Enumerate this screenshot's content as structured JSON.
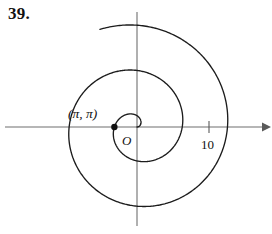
{
  "problem": {
    "number": "39."
  },
  "figure": {
    "name": "spiral-plot",
    "origin_label": "O",
    "point_label": "(π, π)",
    "tick_label": "10",
    "curve_color": "#1c1c1c",
    "axis_color": "#6f6f6f",
    "marker_color": "#111111"
  },
  "chart_data": {
    "type": "line",
    "title": "",
    "subtitle": "",
    "xlabel": "",
    "ylabel": "",
    "grid": false,
    "legend": null,
    "annotations": [
      {
        "text": "(π, π)",
        "x": -3.14,
        "y": 0.0,
        "note": "labeled point on negative x-axis where r = π, θ = π"
      },
      {
        "text": "O",
        "x": 0.0,
        "y": 0.0,
        "note": "origin label"
      }
    ],
    "axes": {
      "x_ticks": [
        10
      ],
      "x_tick_labels": [
        "10"
      ],
      "y_ticks": [],
      "y_tick_labels": [],
      "xlim": [
        -14,
        16
      ],
      "ylim": [
        -13,
        13
      ],
      "x_arrow": true,
      "y_arrow": false
    },
    "series": [
      {
        "name": "Archimedean spiral r = θ",
        "equation": "r = θ",
        "theta_start": 0,
        "theta_end": 14.5,
        "points_polar": [
          {
            "theta": 0.0,
            "r": 0.0
          },
          {
            "theta": 1.5708,
            "r": 1.5708
          },
          {
            "theta": 3.1416,
            "r": 3.1416
          },
          {
            "theta": 4.7124,
            "r": 4.7124
          },
          {
            "theta": 6.2832,
            "r": 6.2832
          },
          {
            "theta": 7.854,
            "r": 7.854
          },
          {
            "theta": 9.4248,
            "r": 9.4248
          },
          {
            "theta": 10.9956,
            "r": 10.9956
          },
          {
            "theta": 12.5664,
            "r": 12.5664
          },
          {
            "theta": 14.1372,
            "r": 14.1372
          }
        ]
      }
    ]
  }
}
